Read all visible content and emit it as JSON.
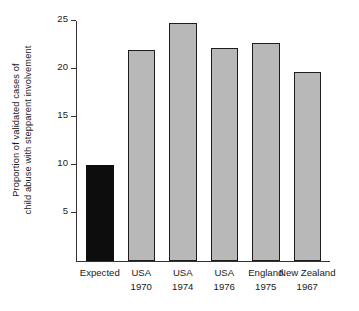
{
  "chart_data": {
    "type": "bar",
    "title": "",
    "xlabel": "",
    "ylabel": "Proportion of validated cases of child abuse with stepparent involvement",
    "ylabel_lines": [
      "Proportion of validated cases of",
      "child abuse with stepparent involvement"
    ],
    "categories": [
      "Expected",
      "USA 1970",
      "USA 1974",
      "USA 1976",
      "England 1975",
      "New Zealand 1967"
    ],
    "category_lines": [
      [
        "Expected",
        ""
      ],
      [
        "USA",
        "1970"
      ],
      [
        "USA",
        "1974"
      ],
      [
        "USA",
        "1976"
      ],
      [
        "England",
        "1975"
      ],
      [
        "New Zealand",
        "1967"
      ]
    ],
    "values": [
      10.0,
      22.0,
      24.8,
      22.2,
      22.7,
      19.7
    ],
    "bar_colors": [
      "#0d0d0d",
      "#b8b8b8",
      "#b8b8b8",
      "#b8b8b8",
      "#b8b8b8",
      "#b8b8b8"
    ],
    "ylim": [
      0,
      25
    ],
    "yticks": [
      5,
      10,
      15,
      20,
      25
    ],
    "ytick_labels": [
      "5",
      "10",
      "15",
      "20",
      "25"
    ],
    "grid": false,
    "legend": null,
    "axis_color": "#333333",
    "bar_edge_color": "#1c1c1c",
    "background": "#ffffff"
  }
}
